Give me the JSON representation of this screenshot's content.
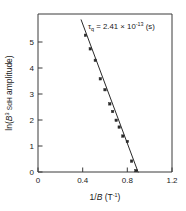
{
  "chart_data": {
    "type": "scatter",
    "title": "",
    "subtitle": "",
    "xlabel_plain": "1/B  (T",
    "xlabel_italic": "B",
    "xlabel_prefix": "1/",
    "xlabel_unit_open": " (T",
    "xlabel_unit_exp": "-1",
    "xlabel_unit_close": ")",
    "ylabel_prefix": "ln(",
    "ylabel_italic": "B",
    "ylabel_exp": "3",
    "ylabel_mid": " SdH amplitude)",
    "ylabel_smallcaps": "SdH",
    "ylabel_full": "ln(B3 SdH amplitude)",
    "xlim": [
      0,
      1.2
    ],
    "ylim": [
      0,
      5.8
    ],
    "xticks": [
      0,
      0.4,
      0.8,
      1.2
    ],
    "xtick_labels": [
      "0",
      "0.4",
      "0.8",
      "1.2"
    ],
    "yticks": [
      0,
      1,
      2,
      3,
      4,
      5
    ],
    "ytick_labels": [
      "0",
      "1",
      "2",
      "3",
      "4",
      "5"
    ],
    "grid": false,
    "legend": "none",
    "series": [
      {
        "name": "SdH amplitude data",
        "marker": "square",
        "x": [
          0.425,
          0.468,
          0.513,
          0.558,
          0.6,
          0.643,
          0.668,
          0.7,
          0.727,
          0.76,
          0.8,
          0.838,
          0.877
        ],
        "y": [
          5.02,
          4.52,
          4.1,
          3.42,
          3.02,
          2.5,
          2.22,
          1.9,
          1.65,
          1.32,
          1.12,
          0.4,
          0.05
        ]
      }
    ],
    "fit_line": {
      "name": "Dingle linear fit",
      "x_start": 0.385,
      "y_start": 5.6,
      "x_end": 0.898,
      "y_end": -0.02,
      "slope": -10.95,
      "intercept": 9.82
    },
    "annotation": {
      "symbol": "τ",
      "subscript": "q",
      "equals": " = ",
      "mantissa": "2.41",
      "times": " × 10",
      "exponent": "-13",
      "unit": " (s)",
      "full_text": "τq = 2.41 × 10-13 (s)"
    }
  },
  "axes": {
    "x_axis_name": "1/B inverse magnetic field axis",
    "y_axis_name": "ln B cubed SdH amplitude axis"
  }
}
